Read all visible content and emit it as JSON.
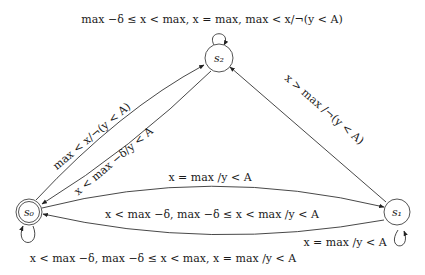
{
  "diagram": {
    "type": "state-machine",
    "nodes": [
      {
        "id": "s0",
        "label": "s₀",
        "accepting": true
      },
      {
        "id": "s1",
        "label": "s₁",
        "accepting": false
      },
      {
        "id": "s2",
        "label": "s₂",
        "accepting": false
      }
    ],
    "edges": [
      {
        "id": "s2_self",
        "from": "s2",
        "to": "s2",
        "label": "max −δ ≤ x < max,  x = max,  max < x/¬(y < A)"
      },
      {
        "id": "s0_to_s2",
        "from": "s0",
        "to": "s2",
        "label": "max < x/¬(y < A)"
      },
      {
        "id": "s2_to_s0",
        "from": "s2",
        "to": "s0",
        "label": "x < max −δ/y < A"
      },
      {
        "id": "s1_to_s2",
        "from": "s1",
        "to": "s2",
        "label": "x > max /¬(y < A)"
      },
      {
        "id": "s0_to_s1",
        "from": "s0",
        "to": "s1",
        "label": "x = max /y < A"
      },
      {
        "id": "s1_to_s0",
        "from": "s1",
        "to": "s0",
        "label": "x < max −δ,  max −δ ≤ x < max /y < A"
      },
      {
        "id": "s1_self",
        "from": "s1",
        "to": "s1",
        "label": "x = max /y < A"
      },
      {
        "id": "s0_self",
        "from": "s0",
        "to": "s0",
        "label": "x < max −δ,  max −δ ≤ x < max,  x = max /y < A"
      }
    ]
  }
}
